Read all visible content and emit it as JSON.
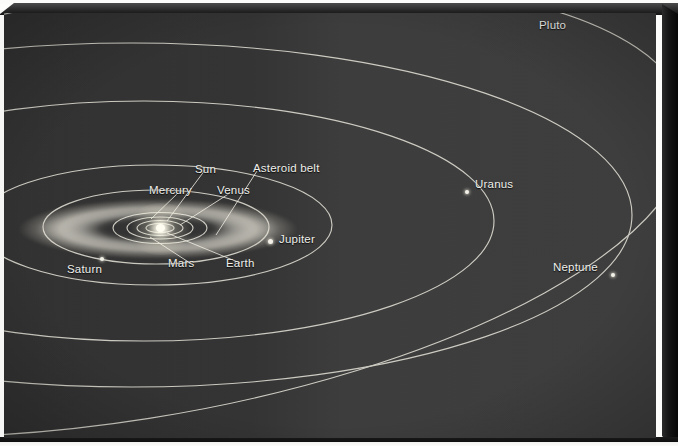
{
  "figure": {
    "kind": "solar-system-orbit-diagram",
    "caption": "",
    "background_color": "#3a3a3a",
    "orbit_line_color": "#d8d6cc",
    "label_color": "#efefeb",
    "sun_color": "#fffdf2"
  },
  "labels": {
    "sun": "Sun",
    "mercury": "Mercury",
    "venus": "Venus",
    "earth": "Earth",
    "mars": "Mars",
    "asteroid_belt": "Asteroid belt",
    "jupiter": "Jupiter",
    "saturn": "Saturn",
    "uranus": "Uranus",
    "neptune": "Neptune",
    "pluto": "Pluto"
  },
  "bodies": [
    {
      "name": "Sun",
      "label": "Sun",
      "has_dot": true,
      "dot_x": 156,
      "dot_y": 215,
      "label_x": 191,
      "label_y": 163,
      "leader": true
    },
    {
      "name": "Mercury",
      "label": "Mercury",
      "has_dot": false,
      "label_x": 148,
      "label_y": 184,
      "leader": true
    },
    {
      "name": "Venus",
      "label": "Venus",
      "has_dot": false,
      "label_x": 215,
      "label_y": 184,
      "leader": true
    },
    {
      "name": "Earth",
      "label": "Earth",
      "has_dot": false,
      "label_x": 224,
      "label_y": 256,
      "leader": true
    },
    {
      "name": "Mars",
      "label": "Mars",
      "has_dot": false,
      "label_x": 166,
      "label_y": 256,
      "leader": true
    },
    {
      "name": "Asteroid belt",
      "label": "Asteroid belt",
      "has_dot": false,
      "label_x": 249,
      "label_y": 162,
      "leader": true
    },
    {
      "name": "Jupiter",
      "label": "Jupiter",
      "has_dot": true,
      "dot_x": 264,
      "dot_y": 226,
      "label_x": 275,
      "label_y": 233,
      "leader": false
    },
    {
      "name": "Saturn",
      "label": "Saturn",
      "has_dot": true,
      "dot_x": 96,
      "dot_y": 244,
      "label_x": 66,
      "label_y": 261,
      "leader": false
    },
    {
      "name": "Uranus",
      "label": "Uranus",
      "has_dot": true,
      "dot_x": 461,
      "dot_y": 177,
      "label_x": 472,
      "label_y": 179,
      "leader": false
    },
    {
      "name": "Neptune",
      "label": "Neptune",
      "has_dot": true,
      "dot_x": 607,
      "dot_y": 260,
      "label_x": 558,
      "label_y": 254,
      "leader": false
    },
    {
      "name": "Pluto",
      "label": "Pluto",
      "has_dot": false,
      "label_x": 536,
      "label_y": 17,
      "leader": false
    }
  ],
  "orbits": [
    {
      "name": "mercury-orbit",
      "rx": 14,
      "ry": 4
    },
    {
      "name": "venus-orbit",
      "rx": 22,
      "ry": 7
    },
    {
      "name": "earth-orbit",
      "rx": 31,
      "ry": 10
    },
    {
      "name": "mars-orbit",
      "rx": 44,
      "ry": 14
    },
    {
      "name": "jupiter-orbit",
      "rx": 110,
      "ry": 34
    },
    {
      "name": "saturn-orbit",
      "rx": 175,
      "ry": 56
    },
    {
      "name": "uranus-orbit",
      "rx": 330,
      "ry": 112
    },
    {
      "name": "neptune-orbit",
      "rx": 470,
      "ry": 160
    },
    {
      "name": "pluto-orbit",
      "rx": 560,
      "ry": 205,
      "inclined": true
    }
  ]
}
